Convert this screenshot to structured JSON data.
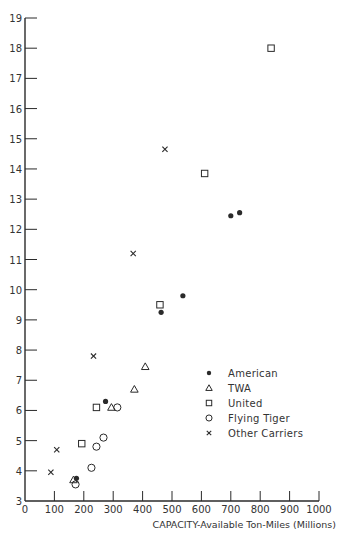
{
  "chart_data": {
    "type": "scatter",
    "title": "",
    "xlabel": "CAPACITY-Available Ton-Miles (Millions)",
    "ylabel": "",
    "xlim": [
      0,
      1000
    ],
    "ylim": [
      3,
      19
    ],
    "x_ticks": [
      0,
      100,
      200,
      300,
      400,
      500,
      600,
      700,
      800,
      900,
      1000
    ],
    "y_ticks": [
      3,
      4,
      5,
      6,
      7,
      8,
      9,
      10,
      11,
      12,
      13,
      14,
      15,
      16,
      17,
      18,
      19
    ],
    "grid": false,
    "legend_position": "lower right (inside plot)",
    "series": [
      {
        "name": "American",
        "marker": "filled-circle",
        "points": [
          {
            "x": 175,
            "y": 3.75
          },
          {
            "x": 274,
            "y": 6.3
          },
          {
            "x": 463,
            "y": 9.25
          },
          {
            "x": 537,
            "y": 9.8
          },
          {
            "x": 700,
            "y": 12.45
          },
          {
            "x": 730,
            "y": 12.55
          }
        ]
      },
      {
        "name": "TWA",
        "marker": "triangle",
        "points": [
          {
            "x": 165,
            "y": 3.7
          },
          {
            "x": 294,
            "y": 6.1
          },
          {
            "x": 372,
            "y": 6.7
          },
          {
            "x": 409,
            "y": 7.45
          }
        ]
      },
      {
        "name": "United",
        "marker": "square",
        "points": [
          {
            "x": 193,
            "y": 4.9
          },
          {
            "x": 243,
            "y": 6.1
          },
          {
            "x": 459,
            "y": 9.5
          },
          {
            "x": 611,
            "y": 13.85
          },
          {
            "x": 837,
            "y": 18.0
          }
        ]
      },
      {
        "name": "Flying Tiger",
        "marker": "open-circle",
        "points": [
          {
            "x": 172,
            "y": 3.55
          },
          {
            "x": 226,
            "y": 4.1
          },
          {
            "x": 243,
            "y": 4.8
          },
          {
            "x": 267,
            "y": 5.1
          },
          {
            "x": 314,
            "y": 6.1
          }
        ]
      },
      {
        "name": "Other Carriers",
        "marker": "x",
        "points": [
          {
            "x": 88,
            "y": 3.95
          },
          {
            "x": 108,
            "y": 4.7
          },
          {
            "x": 233,
            "y": 7.8
          },
          {
            "x": 368,
            "y": 11.2
          },
          {
            "x": 476,
            "y": 14.65
          }
        ]
      }
    ]
  },
  "legend": {
    "items": [
      {
        "label": "American",
        "marker": "filled-circle"
      },
      {
        "label": "TWA",
        "marker": "triangle"
      },
      {
        "label": "United",
        "marker": "square"
      },
      {
        "label": "Flying Tiger",
        "marker": "open-circle"
      },
      {
        "label": "Other Carriers",
        "marker": "x"
      }
    ]
  },
  "colors": {
    "ink": "#2a2a2a",
    "background": "#ffffff"
  }
}
